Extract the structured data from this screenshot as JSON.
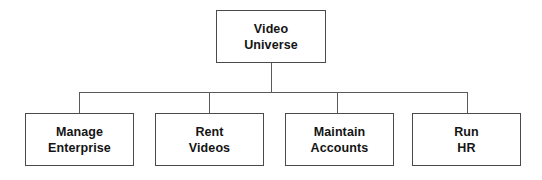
{
  "diagram": {
    "type": "hierarchy-chart",
    "background_color": "#ffffff",
    "border_color": "#4a4a4a",
    "connector_color": "#5a5a5a",
    "text_color": "#141414",
    "root": {
      "id": "video-universe",
      "line1": "Video",
      "line2": "Universe",
      "x": 216,
      "y": 10,
      "width": 110,
      "height": 53
    },
    "children": [
      {
        "id": "manage-enterprise",
        "line1": "Manage",
        "line2": "Enterprise",
        "x": 25,
        "y": 113,
        "width": 109,
        "height": 53,
        "drop_x": 79
      },
      {
        "id": "rent-videos",
        "line1": "Rent",
        "line2": "Videos",
        "x": 155,
        "y": 113,
        "width": 109,
        "height": 53,
        "drop_x": 209
      },
      {
        "id": "maintain-accounts",
        "line1": "Maintain",
        "line2": "Accounts",
        "x": 285,
        "y": 113,
        "width": 109,
        "height": 53,
        "drop_x": 337
      },
      {
        "id": "run-hr",
        "line1": "Run",
        "line2": "HR",
        "x": 412,
        "y": 113,
        "width": 109,
        "height": 53,
        "drop_x": 467
      }
    ],
    "connectors": {
      "root_stem_x": 271,
      "root_stem_top": 63,
      "bus_y": 92,
      "bus_left": 79,
      "bus_right": 467,
      "children_top": 113
    }
  }
}
